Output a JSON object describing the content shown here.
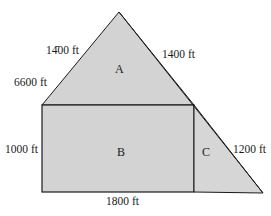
{
  "diagram": {
    "fill_color": "#d3d3d3",
    "stroke_color": "#1a1a1a",
    "regions": {
      "A": "A",
      "B": "B",
      "C": "C"
    },
    "labels": {
      "left_upper_slope": "14̄00 ft",
      "right_upper_slope": "1400 ft",
      "left_lower_slope": "6600 ft",
      "rect_height": "1000 ft",
      "base": "1800 ft",
      "right_lower_slope": "1200 ft"
    }
  }
}
